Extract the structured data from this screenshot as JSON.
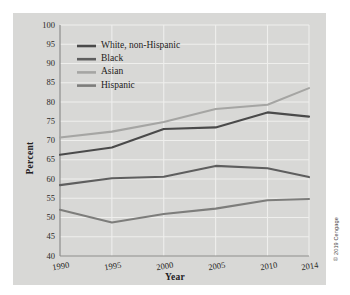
{
  "figure": {
    "credit": "© 2019 Cengage",
    "panel_color": "#d8d8d6",
    "background_color": "#ffffff"
  },
  "chart_data": {
    "type": "line",
    "title": "",
    "xlabel": "Year",
    "ylabel": "Percent",
    "x": [
      1990,
      1995,
      2000,
      2005,
      2010,
      2014
    ],
    "xtick_labels": [
      "1990",
      "1995",
      "2000",
      "2005",
      "2010",
      "2014"
    ],
    "ytick_labels": [
      "40",
      "45",
      "50",
      "55",
      "60",
      "65",
      "70",
      "75",
      "80",
      "85",
      "90",
      "95",
      "100"
    ],
    "xlim": [
      1990,
      2014
    ],
    "ylim": [
      40,
      100
    ],
    "ytick_step": 5,
    "grid": true,
    "grid_color": "#efefed",
    "legend_position": "upper-left",
    "series": [
      {
        "name": "White, non-Hispanic",
        "color": "#4a4a4a",
        "values": [
          66.3,
          68.2,
          73.0,
          73.4,
          77.3,
          76.2
        ]
      },
      {
        "name": "Black",
        "color": "#5e5e5e",
        "values": [
          58.4,
          60.2,
          60.6,
          63.4,
          62.8,
          60.5
        ]
      },
      {
        "name": "Asian",
        "color": "#a5a5a3",
        "values": [
          70.8,
          72.3,
          74.8,
          78.2,
          79.3,
          83.6
        ]
      },
      {
        "name": "Hispanic",
        "color": "#7d7d7b",
        "values": [
          52.0,
          48.7,
          50.9,
          52.3,
          54.5,
          54.8
        ]
      }
    ]
  }
}
